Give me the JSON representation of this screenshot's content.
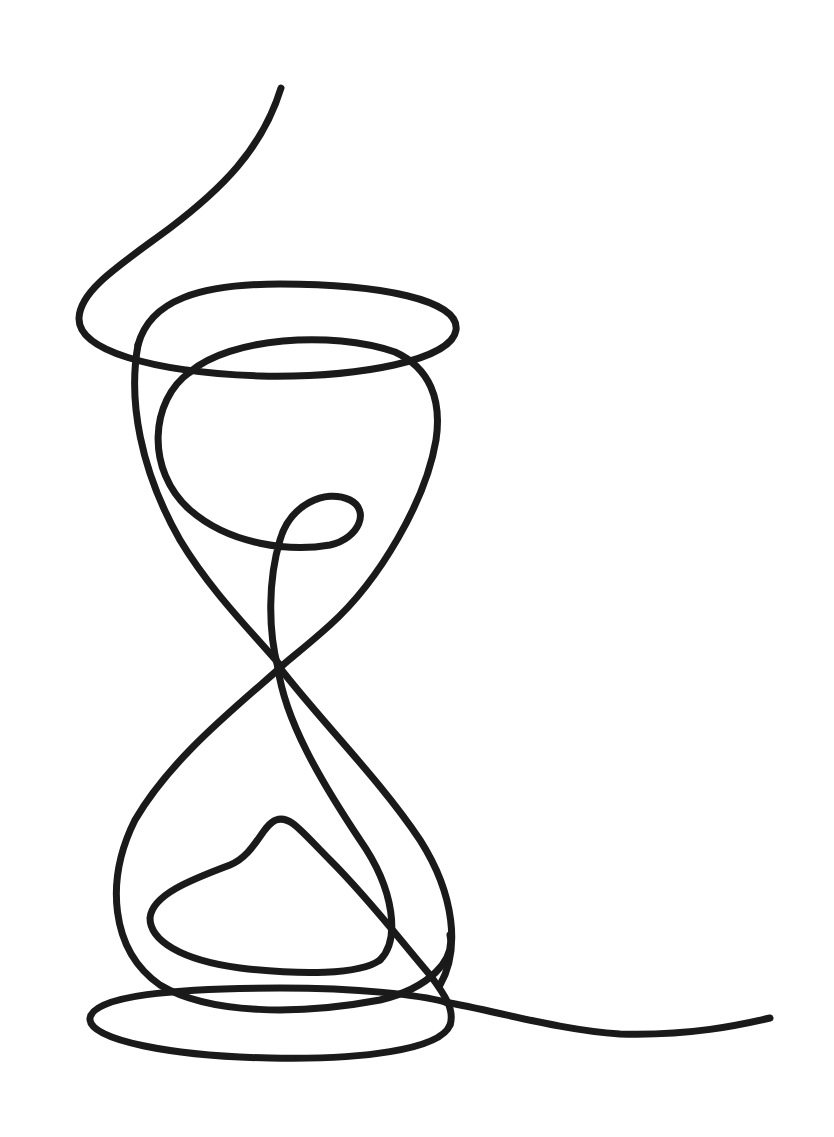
{
  "artwork": {
    "subject": "hourglass",
    "style": "single continuous line drawing",
    "colors": {
      "background": "#ffffff",
      "line": "#1a1a1a"
    },
    "stroke_width": 7
  }
}
